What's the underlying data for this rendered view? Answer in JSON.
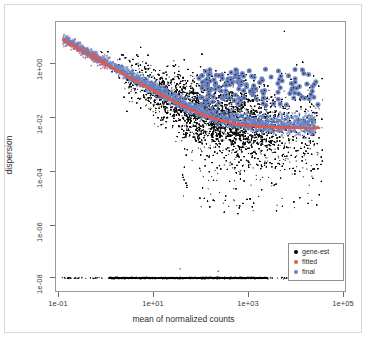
{
  "figure": {
    "width": 367,
    "height": 338,
    "background": "#ffffff",
    "panel_border_color": "#9a9a9a",
    "outer_border_color": "#d8d8d8"
  },
  "chart_data": {
    "type": "scatter",
    "title": "",
    "subtitle": "",
    "xlabel": "mean of normalized counts",
    "ylabel": "dispersion",
    "xscale": "log10",
    "yscale": "log10",
    "xlim": [
      0.05,
      200000
    ],
    "ylim": [
      3e-09,
      30
    ],
    "grid": false,
    "x_tick_labels": [
      "1e-01",
      "1e+01",
      "1e+03",
      "1e+05"
    ],
    "x_tick_values": [
      0.1,
      10,
      1000,
      100000
    ],
    "y_tick_labels": [
      "1e+00",
      "1e-02",
      "1e-04",
      "1e-06",
      "1e-08"
    ],
    "y_tick_values": [
      1,
      0.01,
      0.0001,
      1e-06,
      1e-08
    ],
    "legend": {
      "position": "bottom-right",
      "entries": [
        {
          "label": "gene-est",
          "color": "#000000",
          "marker": "circle"
        },
        {
          "label": "fitted",
          "color": "#e8584a",
          "marker": "circle"
        },
        {
          "label": "final",
          "color": "#6b83c0",
          "marker": "circle"
        }
      ]
    },
    "series": [
      {
        "name": "gene-est",
        "color": "#000000",
        "marker": "circle",
        "size": 1.1,
        "description": "Per-gene maximum-likelihood dispersion estimates. Large black cloud that decreases from ~8 at mean 0.12 down to a broad minimum near 1e-03 around mean 1e+03, with heavy scatter spanning roughly 1e-05 to 1 for means above 1e+02. A dense horizontal stripe of outlier-flagged genes lies at dispersion 1e-08 spanning means 0.1 to ~2e+04.",
        "n_points": 9000
      },
      {
        "name": "fitted",
        "color": "#e8584a",
        "marker": "circle",
        "size": 1.3,
        "description": "Parametric dispersion trend curve: dispersion = 0.0040 + 0.95/mu. Decreases steeply from ~8 at mean 0.12, crosses 1e-02 near mean 90, and asymptotes to 0.0040 for means above 1e+04.",
        "fit": {
          "asymptotic_dispersion": 0.004,
          "extra_pois": 0.95
        }
      },
      {
        "name": "final",
        "color": "#6b83c0",
        "marker": "circle",
        "size": 2.6,
        "description": "Shrunken (MAP) dispersion estimates. Most lie on or just above the fitted red curve forming a blue band; approximately 150 high-dispersion outlier genes are retained at their gene-wise values and appear as large blue dots between dispersion 3e-02 and 6e-01 for means above ~1e+02.",
        "n_outliers": 150
      }
    ],
    "annotations": []
  },
  "axes": {
    "x_ticks": [
      {
        "label": "1e-01",
        "px": 58
      },
      {
        "label": "1e+01",
        "px": 153
      },
      {
        "label": "1e+03",
        "px": 248
      },
      {
        "label": "1e+05",
        "px": 343
      }
    ],
    "y_ticks": [
      {
        "label": "1e+00",
        "px": 63
      },
      {
        "label": "1e-02",
        "px": 117
      },
      {
        "label": "1e-04",
        "px": 171
      },
      {
        "label": "1e-06",
        "px": 225
      },
      {
        "label": "1e-08",
        "px": 277
      }
    ]
  }
}
